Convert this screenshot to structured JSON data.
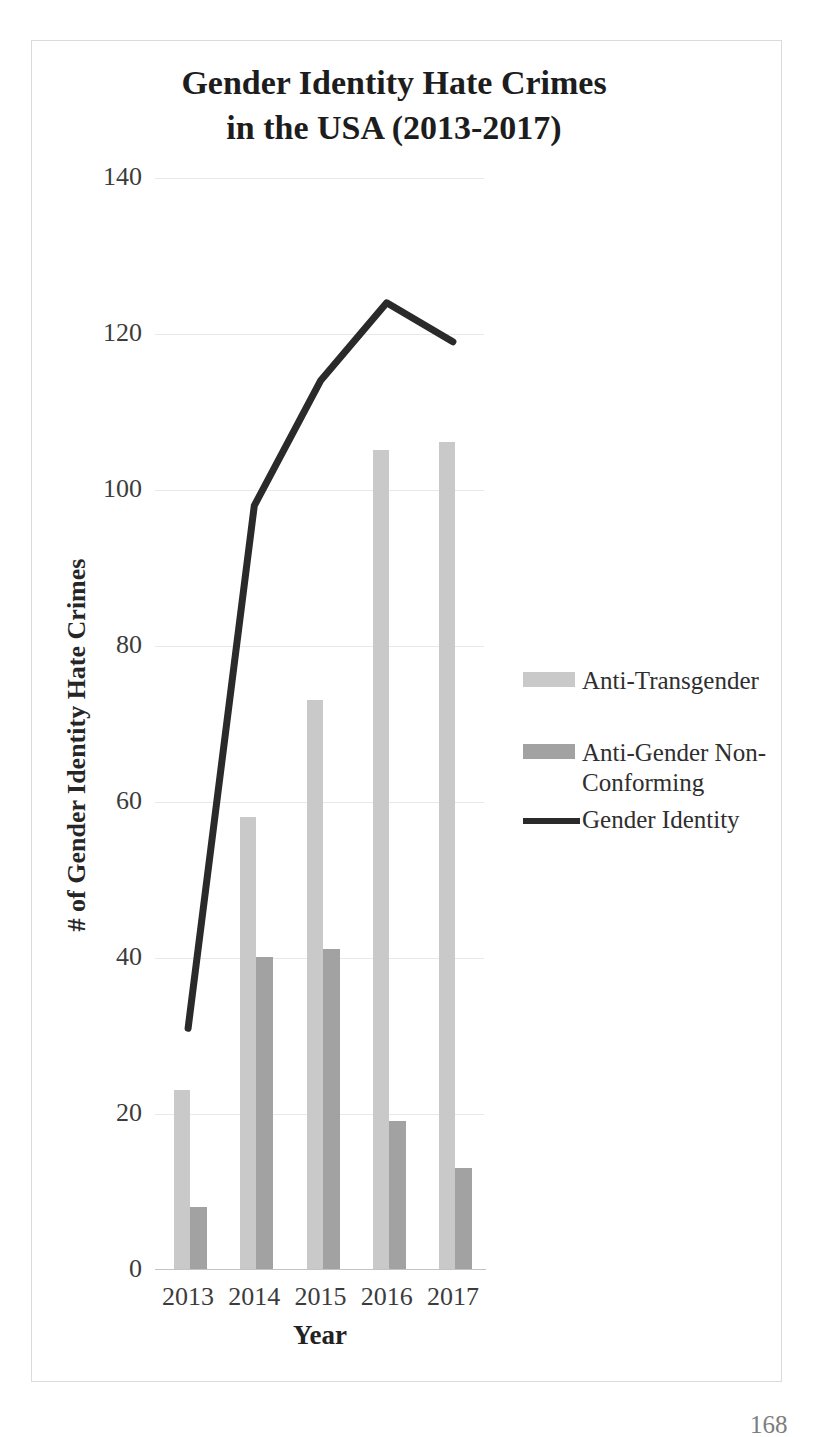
{
  "page": {
    "page_number": "168"
  },
  "chart_data": {
    "type": "bar",
    "subtype": "grouped bars with line overlay",
    "title": "Gender Identity Hate Crimes in the USA (2013-2017)",
    "title_lines": [
      "Gender Identity Hate Crimes",
      "in the USA (2013-2017)"
    ],
    "xlabel": "Year",
    "ylabel": "# of Gender Identity Hate Crimes",
    "categories": [
      "2013",
      "2014",
      "2015",
      "2016",
      "2017"
    ],
    "series": [
      {
        "name": "Anti-Transgender",
        "kind": "bar",
        "color": "#c9c9c9",
        "values": [
          23,
          58,
          73,
          105,
          106
        ]
      },
      {
        "name": "Anti-Gender Non-Conforming",
        "kind": "bar",
        "color": "#a2a2a2",
        "values": [
          8,
          40,
          41,
          19,
          13
        ]
      },
      {
        "name": "Gender Identity",
        "kind": "line",
        "color": "#2a2a2a",
        "values": [
          31,
          98,
          114,
          124,
          119
        ]
      }
    ],
    "ylim": [
      0,
      140
    ],
    "yticks": [
      140,
      120,
      100,
      80,
      60,
      40,
      20,
      0
    ],
    "grid": true,
    "legend_position": "right",
    "legend_items": [
      {
        "swatch": "bar",
        "color": "#c9c9c9",
        "lines": [
          "Anti-Transgender"
        ]
      },
      {
        "swatch": "bar",
        "color": "#a2a2a2",
        "lines": [
          "Anti-Gender Non-",
          "Conforming"
        ]
      },
      {
        "swatch": "line",
        "color": "#2a2a2a",
        "lines": [
          "Gender Identity"
        ]
      }
    ]
  }
}
